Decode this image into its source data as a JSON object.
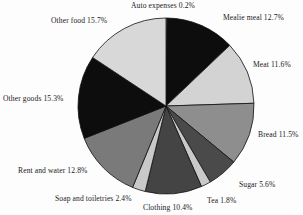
{
  "chart_data": {
    "type": "pie",
    "title": "",
    "xlabel": "",
    "ylabel": "",
    "legend_position": "none",
    "grid": false,
    "start_angle_deg": 0,
    "direction": "clockwise",
    "center": {
      "x": 166,
      "y": 106
    },
    "radius": 88,
    "categories": [
      "Auto expenses",
      "Mealie meal",
      "Meat",
      "Bread",
      "Sugar",
      "Tea",
      "Clothing",
      "Soap and toiletries",
      "Rent and water",
      "Other goods",
      "Other food"
    ],
    "values": [
      0.2,
      12.7,
      11.6,
      11.5,
      5.6,
      1.8,
      10.4,
      2.4,
      12.8,
      15.3,
      15.7
    ],
    "colors": [
      "#cfcfcf",
      "#0d0d0d",
      "#d3d3d3",
      "#8e8e8e",
      "#4a4a4a",
      "#c9c9c9",
      "#444444",
      "#c9c9c9",
      "#7a7a7a",
      "#0d0d0d",
      "#d8d8d8"
    ],
    "slice_stroke": "#111111",
    "labels": [
      "Auto expenses 0.2%",
      "Mealie meal 12.7%",
      "Meat 11.6%",
      "Bread 11.5%",
      "Sugar 5.6%",
      "Tea 1.8%",
      "Clothing 10.4%",
      "Soap and toiletries 2.4%",
      "Rent and water 12.8%",
      "Other goods 15.3%",
      "Other food 15.7%"
    ]
  },
  "labels": {
    "auto_expenses": "Auto expenses 0.2%",
    "mealie_meal": "Mealie meal 12.7%",
    "meat": "Meat 11.6%",
    "bread": "Bread 11.5%",
    "sugar": "Sugar 5.6%",
    "tea": "Tea 1.8%",
    "clothing": "Clothing 10.4%",
    "soap_and_toiletries": "Soap and toiletries 2.4%",
    "rent_and_water": "Rent and water 12.8%",
    "other_goods": "Other goods 15.3%",
    "other_food": "Other food 15.7%"
  }
}
